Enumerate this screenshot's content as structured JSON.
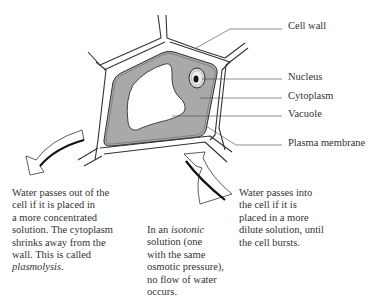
{
  "diagram": {
    "labels": {
      "cell_wall": "Cell wall",
      "nucleus": "Nucleus",
      "cytoplasm": "Cytoplasm",
      "vacuole": "Vacuole",
      "plasma_membrane": "Plasma membrane"
    },
    "colors": {
      "cytoplasm_fill": "#a9a9a9",
      "outline": "#333333",
      "background": "#ffffff"
    }
  },
  "captions": {
    "left": {
      "line1": "Water passes out of the",
      "line2": "cell if it is placed in",
      "line3": "a more concentrated",
      "line4": "solution. The cytoplasm",
      "line5": "shrinks away from the",
      "line6": "wall. This is called",
      "term": "plasmolysis",
      "term_suffix": "."
    },
    "middle": {
      "prefix": "In an ",
      "term": "isotonic",
      "line2": "solution (one",
      "line3": "with the same",
      "line4": "osmotic pressure),",
      "line5": "no flow of water",
      "line6": "occurs."
    },
    "right": {
      "line1": "Water passes into",
      "line2": "the cell if it is",
      "line3": "placed in a more",
      "line4": "dilute solution, until",
      "line5": "the cell bursts."
    }
  },
  "arrows": [
    {
      "name": "water-out-arrow",
      "direction": "out of cell (down-left)"
    },
    {
      "name": "water-in-arrow",
      "direction": "into cell (up-left)"
    }
  ]
}
